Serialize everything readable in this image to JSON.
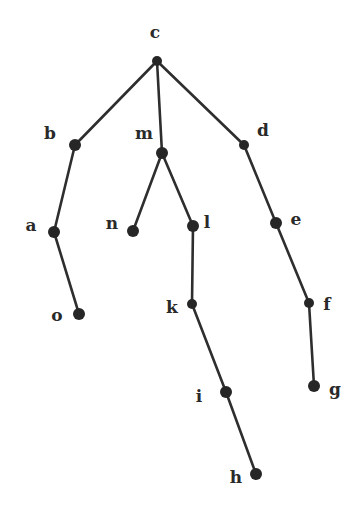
{
  "diagram": {
    "type": "tree",
    "root": "c",
    "style": {
      "edge_color": "#2e2e2e",
      "node_color": "#262626",
      "label_color": "#2a2a2a",
      "background": "#ffffff"
    },
    "nodes": [
      {
        "id": "c",
        "label": "c",
        "x": 157,
        "y": 61,
        "r": 5,
        "lx": 155,
        "ly": 32
      },
      {
        "id": "b",
        "label": "b",
        "x": 75,
        "y": 145,
        "r": 6,
        "lx": 50,
        "ly": 133
      },
      {
        "id": "m",
        "label": "m",
        "x": 162,
        "y": 153,
        "r": 6,
        "lx": 144,
        "ly": 133
      },
      {
        "id": "d",
        "label": "d",
        "x": 244,
        "y": 145,
        "r": 5,
        "lx": 263,
        "ly": 130
      },
      {
        "id": "a",
        "label": "a",
        "x": 54,
        "y": 232,
        "r": 6,
        "lx": 31,
        "ly": 225
      },
      {
        "id": "n",
        "label": "n",
        "x": 133,
        "y": 231,
        "r": 6,
        "lx": 112,
        "ly": 223
      },
      {
        "id": "l",
        "label": "l",
        "x": 193,
        "y": 226,
        "r": 6,
        "lx": 207,
        "ly": 222
      },
      {
        "id": "e",
        "label": "e",
        "x": 276,
        "y": 223,
        "r": 6,
        "lx": 296,
        "ly": 219
      },
      {
        "id": "o",
        "label": "o",
        "x": 79,
        "y": 314,
        "r": 6,
        "lx": 57,
        "ly": 315
      },
      {
        "id": "k",
        "label": "k",
        "x": 192,
        "y": 304,
        "r": 5,
        "lx": 172,
        "ly": 307
      },
      {
        "id": "f",
        "label": "f",
        "x": 309,
        "y": 303,
        "r": 5,
        "lx": 327,
        "ly": 304
      },
      {
        "id": "i",
        "label": "i",
        "x": 226,
        "y": 392,
        "r": 6,
        "lx": 199,
        "ly": 396
      },
      {
        "id": "g",
        "label": "g",
        "x": 314,
        "y": 386,
        "r": 6,
        "lx": 335,
        "ly": 389
      },
      {
        "id": "h",
        "label": "h",
        "x": 256,
        "y": 474,
        "r": 6,
        "lx": 236,
        "ly": 477
      }
    ],
    "edges": [
      [
        "c",
        "b"
      ],
      [
        "c",
        "m"
      ],
      [
        "c",
        "d"
      ],
      [
        "b",
        "a"
      ],
      [
        "a",
        "o"
      ],
      [
        "m",
        "n"
      ],
      [
        "m",
        "l"
      ],
      [
        "l",
        "k"
      ],
      [
        "k",
        "i"
      ],
      [
        "i",
        "h"
      ],
      [
        "d",
        "e"
      ],
      [
        "e",
        "f"
      ],
      [
        "f",
        "g"
      ]
    ]
  }
}
